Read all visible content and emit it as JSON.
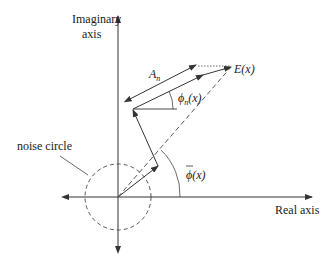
{
  "diagram": {
    "axes": {
      "imaginary_label_line1": "Imaginary",
      "imaginary_label_line2": "axis",
      "real_label": "Real axis"
    },
    "labels": {
      "noise_circle": "noise circle",
      "amplitude": "A",
      "amplitude_sub": "n",
      "phase_n": "ϕ",
      "phase_n_sub": "n",
      "phase_n_arg": "(x)",
      "phase_mean": "ϕ",
      "phase_mean_arg": "(x)",
      "field": "E(x)"
    },
    "colors": {
      "stroke": "#333333",
      "text": "#222222",
      "background": "#ffffff"
    }
  }
}
